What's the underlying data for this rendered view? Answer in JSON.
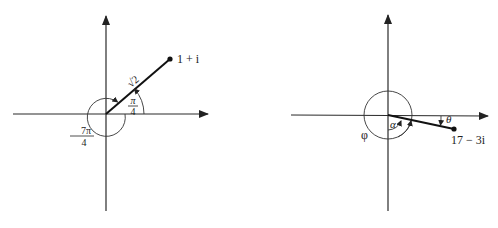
{
  "colors": {
    "ink": "#222222",
    "background": "#ffffff"
  },
  "left_diagram": {
    "origin": [
      106,
      114
    ],
    "point": {
      "x": 170,
      "y": 59,
      "label": "1 + i"
    },
    "modulus_label": "√2",
    "angle_principal": {
      "num": "π",
      "den": "4"
    },
    "angle_negative": {
      "num": "7π",
      "den": "4",
      "sign": "−"
    }
  },
  "right_diagram": {
    "origin": [
      388,
      115
    ],
    "point": {
      "x": 454,
      "y": 129,
      "label": "17 − 3i"
    },
    "angle_labels": {
      "theta": "θ",
      "alpha": "α",
      "phi": "φ"
    }
  }
}
